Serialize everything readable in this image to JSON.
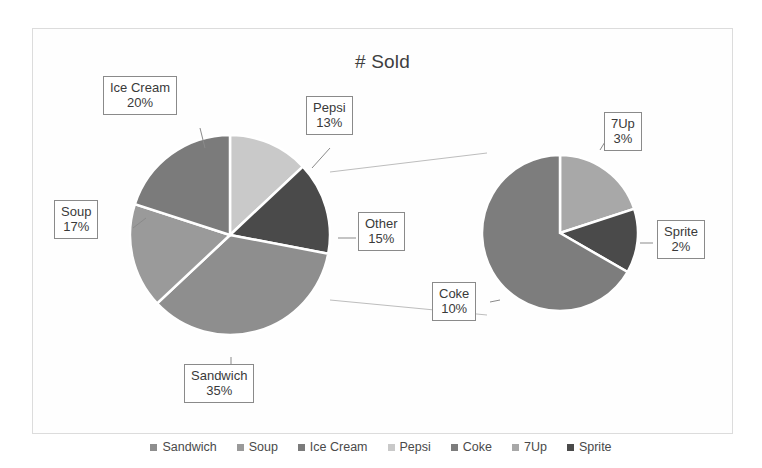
{
  "chart": {
    "title": "# Sold",
    "border_color": "#dcdcdc",
    "background": "#ffffff"
  },
  "chart_data": {
    "type": "pie",
    "title": "# Sold",
    "subtitle": "",
    "xlabel": "",
    "ylabel": "",
    "legend_position": "bottom",
    "grid": false,
    "variant": "pie-of-pie",
    "categories": [
      "Sandwich",
      "Soup",
      "Ice Cream",
      "Pepsi",
      "Coke",
      "7Up",
      "Sprite"
    ],
    "values": [
      35,
      17,
      20,
      13,
      10,
      3,
      2
    ],
    "units": "percent",
    "primary_pie": {
      "name": "# Sold",
      "labels": [
        "Pepsi",
        "Other",
        "Sandwich",
        "Soup",
        "Ice Cream"
      ],
      "values": [
        13,
        15,
        35,
        17,
        20
      ],
      "colors": [
        "#c9c9c9",
        "#4a4a4a",
        "#8e8e8e",
        "#9a9a9a",
        "#7b7b7b"
      ]
    },
    "secondary_pie": {
      "name": "Other",
      "labels": [
        "7Up",
        "Sprite",
        "Coke"
      ],
      "values": [
        3,
        2,
        10
      ],
      "colors": [
        "#a8a8a8",
        "#4a4a4a",
        "#7d7d7d"
      ]
    },
    "annotations": [
      {
        "label": "Ice Cream",
        "value": "20%"
      },
      {
        "label": "Pepsi",
        "value": "13%"
      },
      {
        "label": "Soup",
        "value": "17%"
      },
      {
        "label": "Other",
        "value": "15%"
      },
      {
        "label": "Sandwich",
        "value": "35%"
      },
      {
        "label": "7Up",
        "value": "3%"
      },
      {
        "label": "Sprite",
        "value": "2%"
      },
      {
        "label": "Coke",
        "value": "10%"
      }
    ]
  },
  "callouts": {
    "ice_cream": {
      "label": "Ice Cream",
      "value": "20%"
    },
    "pepsi": {
      "label": "Pepsi",
      "value": "13%"
    },
    "soup": {
      "label": "Soup",
      "value": "17%"
    },
    "other": {
      "label": "Other",
      "value": "15%"
    },
    "sandwich": {
      "label": "Sandwich",
      "value": "35%"
    },
    "sevenup": {
      "label": "7Up",
      "value": "3%"
    },
    "sprite": {
      "label": "Sprite",
      "value": "2%"
    },
    "coke": {
      "label": "Coke",
      "value": "10%"
    }
  },
  "legend": {
    "items": [
      {
        "label": "Sandwich",
        "color": "#8e8e8e"
      },
      {
        "label": "Soup",
        "color": "#9a9a9a"
      },
      {
        "label": "Ice Cream",
        "color": "#7b7b7b"
      },
      {
        "label": "Pepsi",
        "color": "#c9c9c9"
      },
      {
        "label": "Coke",
        "color": "#7d7d7d"
      },
      {
        "label": "7Up",
        "color": "#a8a8a8"
      },
      {
        "label": "Sprite",
        "color": "#4a4a4a"
      }
    ]
  }
}
